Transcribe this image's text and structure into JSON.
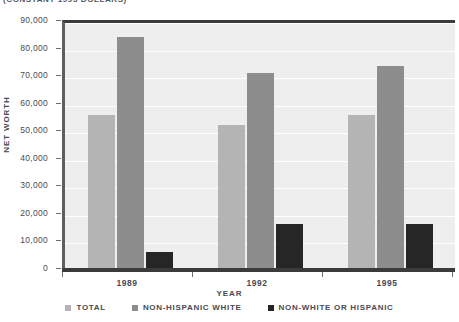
{
  "chart_data": {
    "type": "bar",
    "title": "(CONSTANT 1995 DOLLARS)",
    "xlabel": "YEAR",
    "ylabel": "NET WORTH",
    "categories": [
      "1989",
      "1992",
      "1995"
    ],
    "series": [
      {
        "name": "TOTAL",
        "color": "#b4b4b4",
        "values": [
          56500,
          53000,
          56800
        ]
      },
      {
        "name": "NON-HISPANIC WHITE",
        "color": "#8d8d8d",
        "values": [
          85000,
          71800,
          74300
        ]
      },
      {
        "name": "NON-WHITE OR HISPANIC",
        "color": "#262626",
        "values": [
          7000,
          17000,
          16900
        ]
      }
    ],
    "ylim": [
      0,
      90000
    ],
    "ytick_labels": [
      "0",
      "10,000",
      "20,000",
      "30,000",
      "40,000",
      "50,000",
      "60,000",
      "70,000",
      "80,000",
      "90,000"
    ],
    "ytick_values": [
      0,
      10000,
      20000,
      30000,
      40000,
      50000,
      60000,
      70000,
      80000,
      90000
    ],
    "grid": true,
    "legend_position": "bottom"
  },
  "legend": {
    "items": [
      {
        "label": "TOTAL"
      },
      {
        "label": "NON-HISPANIC WHITE"
      },
      {
        "label": "NON-WHITE OR HISPANIC"
      }
    ]
  }
}
